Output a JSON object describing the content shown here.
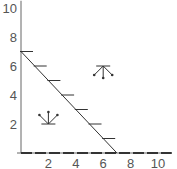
{
  "chart_data": {
    "type": "line",
    "title": "",
    "xlabel": "",
    "ylabel": "",
    "xlim": [
      0,
      11
    ],
    "ylim": [
      0,
      10.5
    ],
    "x_ticks": [
      2,
      4,
      6,
      8,
      10
    ],
    "y_ticks": [
      2,
      4,
      6,
      8,
      10
    ],
    "x_tick_labels": [
      "2",
      "4",
      "6",
      "8",
      "10"
    ],
    "y_tick_labels": [
      "2",
      "4",
      "6",
      "8",
      "10"
    ],
    "grid": false,
    "legend": null,
    "series": [
      {
        "name": "constraint line",
        "x": [
          0,
          7
        ],
        "y": [
          7,
          0
        ],
        "hatch_marks_at_y": [
          7,
          6,
          5,
          4,
          3,
          2,
          1
        ]
      },
      {
        "name": "x-axis constraint (dashed)",
        "x": [
          0,
          11
        ],
        "y": [
          0,
          0
        ]
      }
    ],
    "annotations": [
      {
        "type": "direction-arrows",
        "x": 2,
        "y": 2,
        "direction": "up"
      },
      {
        "type": "direction-arrows",
        "x": 6,
        "y": 6,
        "direction": "down"
      }
    ]
  },
  "colors": {
    "axis": "#666666",
    "line": "#333333",
    "tick_label": "#555555",
    "background": "#ffffff"
  }
}
